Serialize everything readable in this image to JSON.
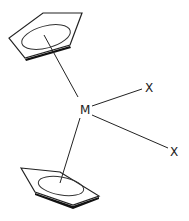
{
  "diagram": {
    "type": "bent metallocene structure",
    "metal_label": "M",
    "ligand_labels": [
      "X",
      "X"
    ],
    "rings": [
      "cyclopentadienyl-top",
      "cyclopentadienyl-bottom"
    ],
    "colors": {
      "stroke": "#222222",
      "background": "#ffffff"
    }
  }
}
